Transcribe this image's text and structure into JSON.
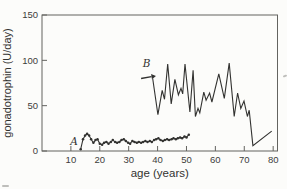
{
  "figure": {
    "background": "#fcfcfa",
    "ink": "#323230",
    "frame_color": "#63635f",
    "tick_text_color": "#3c3c3a"
  },
  "chart_data": {
    "type": "line",
    "title": "",
    "xlabel": "age (years)",
    "ylabel": "gonadotrophin (U/day)",
    "xlim": [
      0,
      81.5
    ],
    "ylim": [
      0,
      150
    ],
    "xticks": [
      10,
      20,
      30,
      40,
      50,
      60,
      70,
      80
    ],
    "yticks": [
      0,
      50,
      100,
      150
    ],
    "grid": false,
    "legend_position": "none (inline italic letter labels A and B)",
    "series": [
      {
        "name": "A",
        "inline_label": "A",
        "label_pos": [
          11.1,
          6.5
        ],
        "marker": "dot",
        "points": [
          [
            13.4,
            2
          ],
          [
            14.2,
            13
          ],
          [
            14.9,
            17
          ],
          [
            15.6,
            19
          ],
          [
            16.3,
            17
          ],
          [
            17.0,
            13
          ],
          [
            17.8,
            9
          ],
          [
            18.5,
            12
          ],
          [
            19.2,
            13
          ],
          [
            20.0,
            8
          ],
          [
            20.8,
            7
          ],
          [
            21.5,
            9
          ],
          [
            22.3,
            10
          ],
          [
            23.0,
            8
          ],
          [
            23.8,
            10
          ],
          [
            24.5,
            12
          ],
          [
            25.3,
            10
          ],
          [
            26.0,
            9
          ],
          [
            26.8,
            10
          ],
          [
            27.5,
            12
          ],
          [
            28.3,
            13
          ],
          [
            29.0,
            11
          ],
          [
            29.8,
            9
          ],
          [
            30.5,
            8
          ],
          [
            31.3,
            11
          ],
          [
            32.0,
            10
          ],
          [
            32.8,
            9
          ],
          [
            33.5,
            10
          ],
          [
            34.3,
            9
          ],
          [
            35.0,
            10
          ],
          [
            35.8,
            11
          ],
          [
            36.5,
            10
          ],
          [
            37.3,
            11
          ],
          [
            38.0,
            10
          ],
          [
            38.8,
            12
          ],
          [
            39.5,
            13
          ],
          [
            40.3,
            14
          ],
          [
            41.0,
            12
          ],
          [
            41.8,
            11
          ],
          [
            42.5,
            12
          ],
          [
            43.3,
            13
          ],
          [
            44.0,
            12
          ],
          [
            44.8,
            13
          ],
          [
            45.5,
            14
          ],
          [
            46.3,
            13
          ],
          [
            47.0,
            14
          ],
          [
            47.8,
            15
          ],
          [
            48.5,
            14
          ],
          [
            49.3,
            16
          ],
          [
            50.0,
            15
          ],
          [
            50.8,
            18
          ]
        ]
      },
      {
        "name": "B",
        "inline_label": "B",
        "label_pos": [
          36.2,
          93
        ],
        "marker": "none",
        "points": [
          [
            38.3,
            80
          ],
          [
            40.1,
            40
          ],
          [
            41.6,
            67
          ],
          [
            42.4,
            57
          ],
          [
            43.5,
            96
          ],
          [
            44.7,
            52
          ],
          [
            46.0,
            79
          ],
          [
            47.2,
            62
          ],
          [
            48.1,
            69
          ],
          [
            48.7,
            63
          ],
          [
            49.5,
            96
          ],
          [
            51.2,
            43
          ],
          [
            52.3,
            89
          ],
          [
            53.1,
            38
          ],
          [
            54.0,
            47
          ],
          [
            54.6,
            42
          ],
          [
            56.0,
            65
          ],
          [
            56.8,
            56
          ],
          [
            58.0,
            64
          ],
          [
            58.8,
            54
          ],
          [
            61.2,
            85
          ],
          [
            63.1,
            58
          ],
          [
            64.8,
            97
          ],
          [
            66.5,
            38
          ],
          [
            67.7,
            64
          ],
          [
            68.8,
            47
          ],
          [
            69.9,
            55
          ],
          [
            71.1,
            38
          ],
          [
            71.7,
            45
          ],
          [
            73.0,
            6
          ],
          [
            79.5,
            22
          ]
        ]
      }
    ],
    "annotations": [
      {
        "type": "arrow",
        "label_for": "B",
        "from": [
          34.3,
          80
        ],
        "to": [
          37.9,
          82
        ]
      }
    ]
  }
}
